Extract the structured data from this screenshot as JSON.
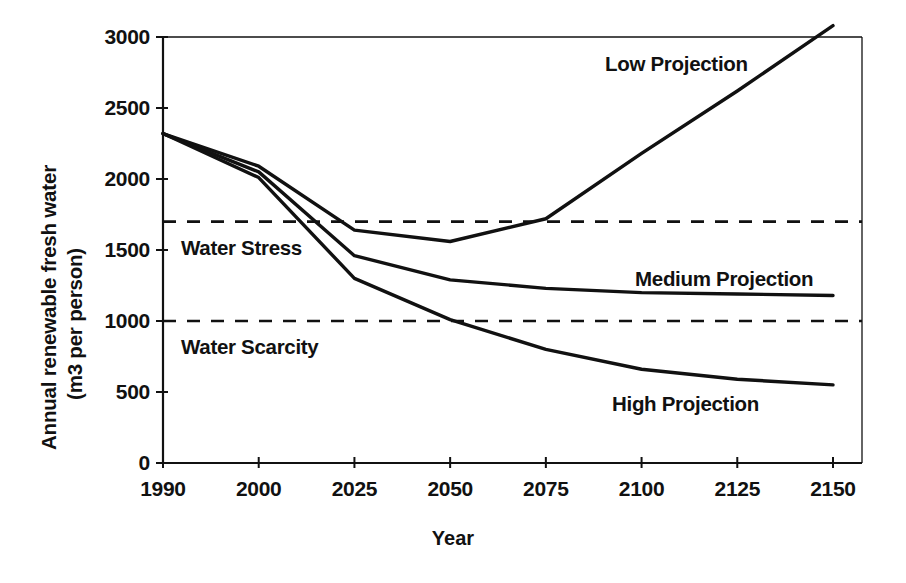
{
  "chart_data": {
    "type": "line",
    "title": "",
    "xlabel": "Year",
    "ylabel": "Annual renewable fresh water (m3 per person)",
    "ylabel_line1": "Annual renewable fresh water",
    "ylabel_line2": "(m3 per person)",
    "categories": [
      "1990",
      "2000",
      "2025",
      "2050",
      "2075",
      "2100",
      "2125",
      "2150"
    ],
    "x": [
      1990,
      2000,
      2025,
      2050,
      2075,
      2100,
      2125,
      2150
    ],
    "ylim": [
      0,
      3000
    ],
    "yticks": [
      0,
      500,
      1000,
      1500,
      2000,
      2500,
      3000
    ],
    "ytick_labels": [
      "0",
      "500",
      "1000",
      "1500",
      "2000",
      "2500",
      "3000"
    ],
    "grid": false,
    "legend_position": "inline-annotations",
    "series": [
      {
        "name": "Low Projection",
        "values": [
          2320,
          2090,
          1640,
          1560,
          1720,
          2180,
          2620,
          3080
        ]
      },
      {
        "name": "Medium Projection",
        "values": [
          2320,
          2050,
          1460,
          1290,
          1230,
          1200,
          1190,
          1180
        ]
      },
      {
        "name": "High Projection",
        "values": [
          2320,
          2010,
          1300,
          1010,
          800,
          660,
          590,
          550
        ]
      }
    ],
    "threshold_lines": [
      {
        "label": "Water Stress",
        "value": 1700,
        "style": "dashed"
      },
      {
        "label": "Water Scarcity",
        "value": 1000,
        "style": "dashed"
      }
    ],
    "annotations": [
      {
        "name": "low-projection-label",
        "text": "Low Projection"
      },
      {
        "name": "medium-projection-label",
        "text": "Medium Projection"
      },
      {
        "name": "high-projection-label",
        "text": "High Projection"
      },
      {
        "name": "water-stress-label",
        "text": "Water Stress"
      },
      {
        "name": "water-scarcity-label",
        "text": "Water Scarcity"
      }
    ],
    "colors": {
      "line": "#111111",
      "axis": "#111111",
      "background": "#ffffff"
    }
  }
}
